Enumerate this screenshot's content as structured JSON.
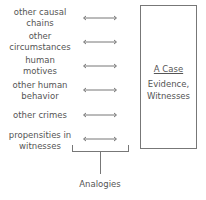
{
  "left_labels": [
    {
      "line1": "other causal",
      "line2": "chains"
    },
    {
      "line1": "other",
      "line2": "circumstances"
    },
    {
      "line1": "human",
      "line2": "motives"
    },
    {
      "line1": "other human",
      "line2": "behavior"
    },
    {
      "line1": "other crimes",
      "line2": ""
    },
    {
      "line1": "propensities in",
      "line2": "witnesses"
    }
  ],
  "case_box": {
    "title": "A Case",
    "line1": "Evidence,",
    "line2": "Witnesses"
  },
  "bracket_label": "Analogies",
  "colors": {
    "line": "#777777",
    "text": "#555555"
  }
}
